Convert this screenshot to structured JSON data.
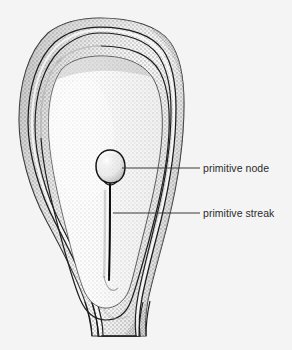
{
  "figure": {
    "kind": "stippled-anatomical-illustration",
    "background_color": "#f4f4f5",
    "ink_color": "#1d1d1d",
    "stipple_color": "#9a9a9a",
    "shadow_color": "#6e6e6e"
  },
  "labels": [
    {
      "id": "primitive-node",
      "text": "primitive node",
      "text_color": "#2b2b2b",
      "leader": {
        "from_x": 122,
        "from_y": 168,
        "to_x": 200,
        "to_y": 168,
        "color": "#3a3a3a"
      }
    },
    {
      "id": "primitive-streak",
      "text": "primitive streak",
      "text_color": "#2b2b2b",
      "leader": {
        "from_x": 113,
        "from_y": 213,
        "to_x": 200,
        "to_y": 213,
        "color": "#3a3a3a"
      }
    }
  ],
  "structures": [
    {
      "id": "outer-amniotic-fold",
      "name": "outer amniotic fold"
    },
    {
      "id": "middle-amniotic-fold",
      "name": "middle amniotic fold"
    },
    {
      "id": "inner-amniotic-fold",
      "name": "inner amniotic fold"
    },
    {
      "id": "embryonic-disc",
      "name": "embryonic disc"
    },
    {
      "id": "primitive-node-shape",
      "name": "primitive node"
    },
    {
      "id": "primitive-streak-line",
      "name": "primitive streak"
    },
    {
      "id": "connecting-stalk",
      "name": "connecting stalk"
    }
  ]
}
